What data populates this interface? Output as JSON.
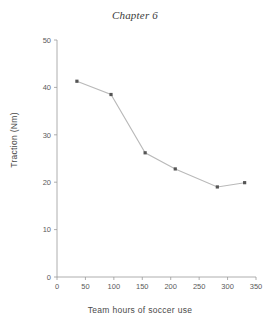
{
  "chart_data": {
    "type": "line",
    "title": "Chapter 6",
    "xlabel": "Team hours of soccer use",
    "ylabel": "Traction (Nm)",
    "xlim": [
      0,
      350
    ],
    "ylim": [
      0,
      50
    ],
    "xticks": [
      0,
      50,
      100,
      150,
      200,
      250,
      300,
      350
    ],
    "yticks": [
      0,
      10,
      20,
      30,
      40,
      50
    ],
    "grid": false,
    "legend": "none",
    "marker": "square",
    "line_color": "#b9b9b9",
    "marker_color": "#555555",
    "x": [
      35,
      95,
      155,
      208,
      282,
      330
    ],
    "values": [
      41.3,
      38.5,
      26.2,
      22.8,
      19.0,
      19.9
    ],
    "series": [
      {
        "name": "traction",
        "points": [
          {
            "x": 35,
            "y": 41.3
          },
          {
            "x": 95,
            "y": 38.5
          },
          {
            "x": 155,
            "y": 26.2
          },
          {
            "x": 208,
            "y": 22.8
          },
          {
            "x": 282,
            "y": 19.0
          },
          {
            "x": 330,
            "y": 19.9
          }
        ]
      }
    ]
  },
  "figure": {
    "title": "Chapter 6",
    "xlabel": "Team hours of soccer use",
    "ylabel": "Traction (Nm)"
  }
}
